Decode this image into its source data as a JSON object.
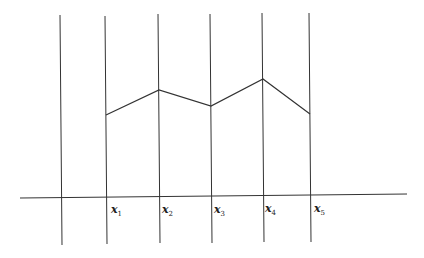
{
  "diagram": {
    "labels": [
      {
        "base": "x",
        "sub": "1"
      },
      {
        "base": "x",
        "sub": "2"
      },
      {
        "base": "x",
        "sub": "3"
      },
      {
        "base": "x",
        "sub": "4"
      },
      {
        "base": "x",
        "sub": "5"
      }
    ],
    "line_color": "#333333"
  }
}
